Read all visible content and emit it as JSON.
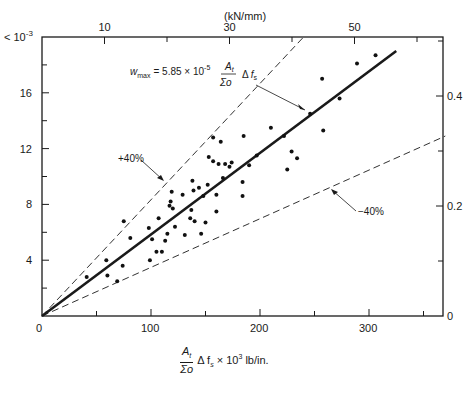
{
  "chart_data": {
    "type": "scatter",
    "title": "",
    "xlabel": "At/Σo Δfs × 10^3 lb/in.",
    "xlabel_top": "(kN/mm)",
    "ylabel_left": "× 10^-3",
    "ylabel_right": "",
    "xlim": [
      0,
      370
    ],
    "ylim": [
      0,
      20
    ],
    "x_ticks": [
      0,
      100,
      200,
      300
    ],
    "x_minor_ticks": [
      50,
      150,
      250,
      350
    ],
    "y_ticks": [
      0,
      4,
      8,
      12,
      16
    ],
    "y_minor_ticks": [
      2,
      6,
      10,
      14,
      18
    ],
    "top_ticks": [
      10,
      30,
      50
    ],
    "top_minor_ticks": [
      20,
      40,
      60
    ],
    "right_ticks": [
      0,
      0.2,
      0.4
    ],
    "right_minor_ticks": [
      0.1,
      0.3,
      0.5
    ],
    "y_scale_label": "× 10⁻³",
    "grid": false,
    "equation": "w_max = 5.85 × 10^-5 (At/Σo) Δfs",
    "series": [
      {
        "name": "w_max fit",
        "style": "solid-thick",
        "x": [
          0,
          325
        ],
        "y": [
          0,
          19.0
        ]
      },
      {
        "name": "+40%",
        "style": "dashed",
        "x": [
          0,
          240
        ],
        "y": [
          0,
          20.0
        ]
      },
      {
        "name": "-40%",
        "style": "dashed",
        "x": [
          0,
          370
        ],
        "y": [
          0,
          12.9
        ]
      },
      {
        "name": "test data",
        "style": "points",
        "points": [
          [
            41,
            2.8
          ],
          [
            59,
            4.0
          ],
          [
            60,
            2.9
          ],
          [
            69,
            2.5
          ],
          [
            74,
            3.6
          ],
          [
            75,
            6.8
          ],
          [
            81,
            5.6
          ],
          [
            98,
            6.3
          ],
          [
            99,
            4.0
          ],
          [
            101,
            5.5
          ],
          [
            105,
            4.6
          ],
          [
            107,
            7.0
          ],
          [
            110,
            4.6
          ],
          [
            113,
            5.4
          ],
          [
            115,
            5.9
          ],
          [
            117,
            7.9
          ],
          [
            118,
            8.2
          ],
          [
            119,
            8.9
          ],
          [
            120,
            7.7
          ],
          [
            122,
            6.4
          ],
          [
            129,
            8.7
          ],
          [
            131,
            5.8
          ],
          [
            136,
            7.0
          ],
          [
            137,
            7.6
          ],
          [
            138,
            9.7
          ],
          [
            139,
            9.0
          ],
          [
            140,
            6.8
          ],
          [
            144,
            9.2
          ],
          [
            146,
            5.9
          ],
          [
            148,
            8.6
          ],
          [
            150,
            6.7
          ],
          [
            152,
            9.4
          ],
          [
            153,
            11.4
          ],
          [
            157,
            12.8
          ],
          [
            157,
            11.1
          ],
          [
            160,
            8.7
          ],
          [
            160,
            7.5
          ],
          [
            162,
            10.9
          ],
          [
            164,
            12.5
          ],
          [
            166,
            9.9
          ],
          [
            168,
            10.9
          ],
          [
            172,
            10.7
          ],
          [
            174,
            11.0
          ],
          [
            184,
            9.6
          ],
          [
            184,
            8.6
          ],
          [
            185,
            12.9
          ],
          [
            190,
            10.8
          ],
          [
            197,
            11.5
          ],
          [
            210,
            13.5
          ],
          [
            222,
            12.9
          ],
          [
            225,
            10.5
          ],
          [
            229,
            11.8
          ],
          [
            234,
            11.3
          ],
          [
            246,
            14.5
          ],
          [
            257,
            17.0
          ],
          [
            258,
            13.3
          ],
          [
            273,
            15.6
          ],
          [
            289,
            18.1
          ],
          [
            306,
            18.7
          ]
        ]
      }
    ],
    "annotations": [
      {
        "text": "+40%",
        "x": 70,
        "y": 12.0
      },
      {
        "text": "-40%",
        "x": 250,
        "y": 8.2
      },
      {
        "text": "w_max = 5.85 × 10^-5 At/Σo Δfs",
        "x": 95,
        "y": 17.3
      }
    ]
  },
  "labels": {
    "y_scale": "< 10",
    "y_scale_exp": "-3",
    "top_unit": "(kN/mm)",
    "plus40": "+40%",
    "minus40": "−40%",
    "eq_w": "w",
    "eq_sub": "max",
    "eq_eq": "= 5.85 × 10",
    "eq_exp": "-5",
    "eq_num": "A",
    "eq_num_sub": "t",
    "eq_den": "Σo",
    "eq_delta": "Δ",
    "eq_f": "f",
    "eq_f_sub": "s",
    "xl_num": "A",
    "xl_num_sub": "t",
    "xl_den": "Σo",
    "xl_rest": "Δ f",
    "xl_rest_sub": "s",
    "xl_tail": "× 10",
    "xl_tail_exp": "3",
    "xl_unit": "lb/in."
  }
}
